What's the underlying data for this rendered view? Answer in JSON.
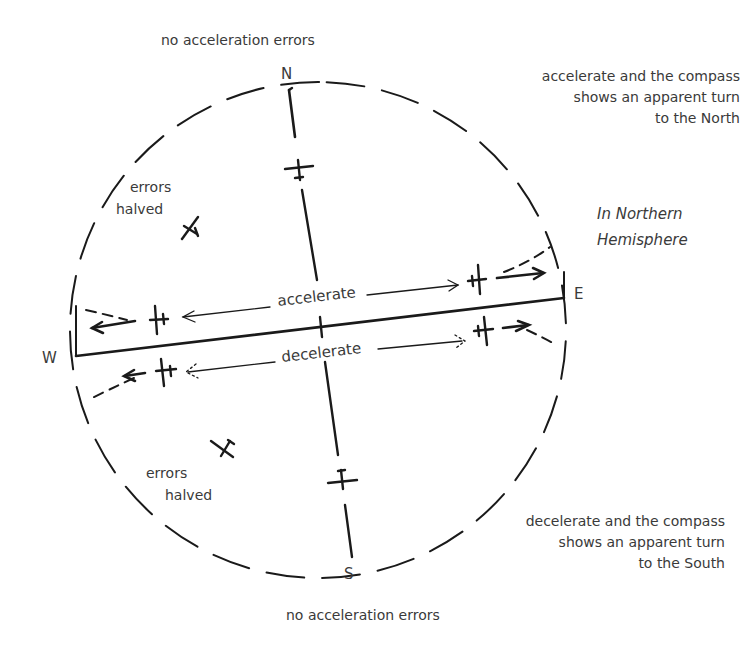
{
  "diagram": {
    "hemisphere_label": [
      "In Northern",
      "Hemisphere"
    ],
    "cardinals": {
      "north": "N",
      "south": "S",
      "east": "E",
      "west": "W"
    },
    "top_label": "no acceleration errors",
    "bottom_label": "no acceleration errors",
    "northeast_note": [
      "accelerate and the compass",
      "shows an apparent turn",
      "to the North"
    ],
    "southeast_note": [
      "decelerate and the compass",
      "shows an apparent turn",
      "to the South"
    ],
    "errors_halved_nw": [
      "errors",
      "halved"
    ],
    "errors_halved_sw": [
      "errors",
      "halved"
    ],
    "accelerate_label": "accelerate",
    "decelerate_label": "decelerate",
    "colors": {
      "ink": "#1a1a1a",
      "text": "#3a3a3a",
      "background": "#ffffff"
    }
  }
}
